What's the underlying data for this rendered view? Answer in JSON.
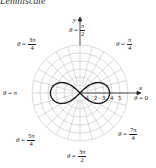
{
  "title": "Lemniscate",
  "graph": {
    "curve": "lemniscate",
    "center": [
      80,
      93
    ],
    "px_per_unit": 8,
    "grid_circles": [
      1,
      2,
      3,
      4,
      5,
      6
    ],
    "grid_angle_step_deg": 15,
    "curve_extent_units": 3.7,
    "x_axis_label": "x",
    "y_axis_label": "y",
    "tick_labels": [
      "1",
      "2",
      "3",
      "4",
      "5"
    ],
    "angle_labels": [
      {
        "id": "theta-pi-over-2",
        "prefix": "θ",
        "eq": "=",
        "num": "π",
        "den": "2"
      },
      {
        "id": "theta-3pi-over-4",
        "prefix": "θ",
        "eq": "=",
        "num": "3π",
        "den": "4"
      },
      {
        "id": "theta-pi-over-4",
        "prefix": "θ",
        "eq": "=",
        "num": "π",
        "den": "4"
      },
      {
        "id": "theta-pi",
        "prefix": "θ",
        "eq": "=",
        "value": "π"
      },
      {
        "id": "theta-0",
        "prefix": "θ",
        "eq": "=",
        "value": "0"
      },
      {
        "id": "theta-5pi-over-4",
        "prefix": "θ",
        "eq": "=",
        "num": "5π",
        "den": "4"
      },
      {
        "id": "theta-7pi-over-4",
        "prefix": "θ",
        "eq": "=",
        "num": "7π",
        "den": "4"
      },
      {
        "id": "theta-3pi-over-2",
        "prefix": "θ",
        "eq": "=",
        "num": "3π",
        "den": "2"
      }
    ]
  }
}
